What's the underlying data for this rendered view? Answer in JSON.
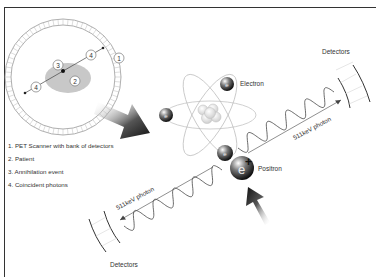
{
  "legend": {
    "items": [
      "1. PET Scanner with bank of detectors",
      "2. Patient",
      "3. Annihilation event",
      "4. Coincident photons"
    ]
  },
  "scanner": {
    "markers": [
      "1",
      "2",
      "3",
      "4",
      "4"
    ]
  },
  "labels": {
    "electron": "Electron",
    "positron": "Positron",
    "detectors_top": "Detectors",
    "detectors_bottom": "Detectors",
    "photon_upper": "511keV photon",
    "photon_lower": "511keV photon",
    "electron_symbol": "e",
    "positron_symbol": "e+"
  },
  "colors": {
    "frame": "#333333",
    "patient": "#c8c8c8",
    "arrow_dark": "#222222",
    "text": "#333333"
  }
}
